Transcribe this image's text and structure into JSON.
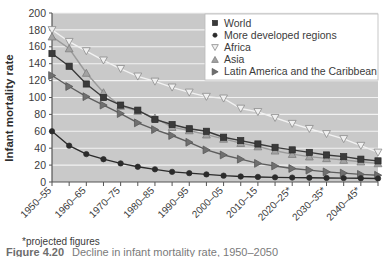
{
  "figure": {
    "caption_label": "Figure 4.20",
    "caption_text": "Decline in infant mortality rate, 1950–2050",
    "footnote": "*projected figures"
  },
  "chart_data": {
    "type": "line",
    "title": "",
    "xlabel": "",
    "ylabel": "Infant mortality rate",
    "ylim": [
      0,
      200
    ],
    "y_ticks": [
      0,
      20,
      40,
      60,
      80,
      100,
      120,
      140,
      160,
      180,
      200
    ],
    "grid": "horizontal-white",
    "legend_position": "top-right",
    "plot_background": "#c9c9c9",
    "gridline_color": "#f2f2f2",
    "x": [
      "1950–55",
      "1955–60",
      "1960–65",
      "1965–70",
      "1970–75",
      "1975–80",
      "1980–85",
      "1985–90",
      "1990–95",
      "1995–2000",
      "2000–05",
      "2005–10",
      "2010–15",
      "2015–20",
      "2020–25*",
      "2025–30*",
      "2030–35*",
      "2035–40*",
      "2040–45*",
      "2045–50*"
    ],
    "x_tick_labels": [
      "1950–55",
      "1960–65",
      "1970–75",
      "1980–85",
      "1990–95",
      "2000–05",
      "2010–15",
      "2020–25*",
      "2030–35*",
      "2040–45*"
    ],
    "x_tick_label_indices": [
      0,
      2,
      4,
      6,
      8,
      10,
      12,
      14,
      16,
      18
    ],
    "series": [
      {
        "name": "World",
        "marker": "square",
        "marker_fill": "#3a3a3a",
        "marker_stroke": "#2b2b2b",
        "line_color": "#3a3a3a",
        "values": [
          152,
          137,
          116,
          100,
          91,
          85,
          74,
          68,
          63,
          60,
          53,
          49,
          45,
          41,
          38,
          35,
          32,
          30,
          27,
          25
        ]
      },
      {
        "name": "More developed regions",
        "marker": "circle",
        "marker_fill": "#2b2b2b",
        "marker_stroke": "#2b2b2b",
        "line_color": "#2b2b2b",
        "values": [
          60,
          43,
          33,
          27,
          22,
          18,
          15,
          12,
          10.5,
          9,
          7.5,
          6.5,
          6,
          5.5,
          5.2,
          5,
          4.8,
          4.6,
          4.4,
          4.2
        ]
      },
      {
        "name": "Africa",
        "marker": "triangle-down-open",
        "marker_fill": "#f0f0f0",
        "marker_stroke": "#8c8c8c",
        "line_color": "#f2f2f2",
        "values": [
          180,
          166,
          155,
          144,
          134,
          125,
          119,
          112,
          106,
          101,
          99,
          87,
          83,
          76,
          69,
          63,
          57,
          51,
          43,
          35
        ]
      },
      {
        "name": "Asia",
        "marker": "triangle-up",
        "marker_fill": "#a3a3a3",
        "marker_stroke": "#7d7d7d",
        "line_color": "#9a9a9a",
        "values": [
          172,
          158,
          129,
          106,
          90,
          84,
          76,
          65,
          61,
          56,
          51,
          46,
          42,
          37,
          33,
          30,
          28,
          26,
          24,
          22
        ]
      },
      {
        "name": "Latin America and the Caribbean",
        "marker": "triangle-right",
        "marker_fill": "#6f6f6f",
        "marker_stroke": "#585858",
        "line_color": "#5e5e5e",
        "values": [
          126,
          113,
          101,
          91,
          81,
          70,
          62,
          55,
          47,
          38,
          32,
          27,
          22,
          19,
          16,
          14,
          12,
          10.5,
          9,
          8
        ]
      }
    ]
  }
}
